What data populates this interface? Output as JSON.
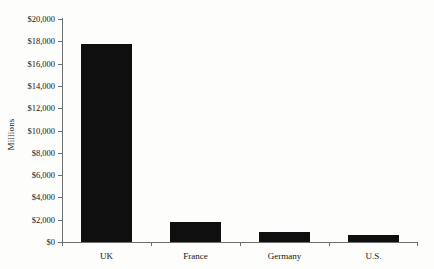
{
  "chart_data": {
    "type": "bar",
    "title": "",
    "xlabel": "",
    "ylabel": "Millions",
    "categories": [
      "UK",
      "France",
      "Germany",
      "U.S."
    ],
    "values": [
      17800,
      1800,
      900,
      600
    ],
    "ylim": [
      0,
      20000
    ],
    "ytick_values": [
      0,
      2000,
      4000,
      6000,
      8000,
      10000,
      12000,
      14000,
      16000,
      18000,
      20000
    ],
    "ytick_labels": [
      "$0",
      "$2,000",
      "$4,000",
      "$6,000",
      "$8,000",
      "$10,000",
      "$12,000",
      "$14,000",
      "$16,000",
      "$18,000",
      "$20,000"
    ],
    "grid": false,
    "legend": null,
    "bar_color": "#100f0f",
    "axis_color": "#6f6f6f",
    "background_color": "#fdfdfc"
  }
}
